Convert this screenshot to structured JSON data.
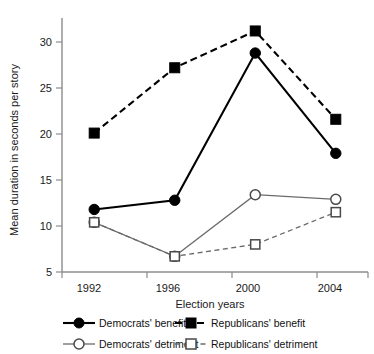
{
  "chart_data": {
    "type": "line",
    "title": "",
    "xlabel": "Election years",
    "ylabel": "Mean duration in seconds per story",
    "categories": [
      "1992",
      "1996",
      "2000",
      "2004"
    ],
    "x": [
      1992,
      1996,
      2000,
      2004
    ],
    "xlim": [
      1990.4,
      2005.6
    ],
    "ylim": [
      5,
      32.5
    ],
    "yticks": [
      5,
      10,
      15,
      20,
      25,
      30
    ],
    "ytick_labels": [
      "5",
      "10",
      "15",
      "20",
      "25",
      "30"
    ],
    "grid": false,
    "legend_position": "below",
    "series": [
      {
        "name": "Democrats' benefit",
        "values": [
          11.8,
          12.8,
          28.8,
          17.9
        ],
        "marker": "filled-circle",
        "line_style": "solid",
        "color": "#000000"
      },
      {
        "name": "Republicans' benefit",
        "values": [
          20.1,
          27.2,
          31.2,
          21.6
        ],
        "marker": "filled-square",
        "line_style": "dashed",
        "color": "#000000"
      },
      {
        "name": "Democrats' detriment",
        "values": [
          10.4,
          6.7,
          13.4,
          12.9
        ],
        "marker": "open-circle",
        "line_style": "solid",
        "color": "#6b6b6b"
      },
      {
        "name": "Republicans' detriment",
        "values": [
          10.4,
          6.7,
          8.0,
          11.5
        ],
        "marker": "open-square",
        "line_style": "dashed",
        "color": "#6b6b6b"
      }
    ]
  },
  "axes": {
    "y_label": "Mean duration in seconds per story",
    "x_label": "Election years",
    "y_tick_5": "5",
    "y_tick_10": "10",
    "y_tick_15": "15",
    "y_tick_20": "20",
    "y_tick_25": "25",
    "y_tick_30": "30",
    "x_tick_1": "1992",
    "x_tick_2": "1996",
    "x_tick_3": "2000",
    "x_tick_4": "2004"
  },
  "legend": {
    "entries": [
      {
        "label": "Democrats' benefit",
        "key": "filled-circle-solid-line"
      },
      {
        "label": "Republicans' benefit",
        "key": "filled-square-dashed-line"
      },
      {
        "label": "Democrats' detriment",
        "key": "open-circle-solid-line"
      },
      {
        "label": "Republicans' detriment",
        "key": "open-square-dashed-line"
      }
    ]
  }
}
